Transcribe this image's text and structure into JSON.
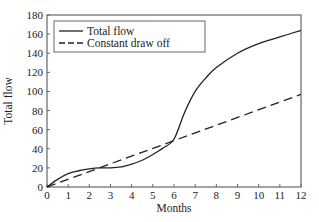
{
  "chart_data": {
    "type": "line",
    "title": "",
    "xlabel": "Months",
    "ylabel": "Total flow",
    "xlim": [
      0,
      12
    ],
    "ylim": [
      0,
      180
    ],
    "xticks": [
      0,
      1,
      2,
      3,
      4,
      5,
      6,
      7,
      8,
      9,
      10,
      11,
      12
    ],
    "yticks": [
      0,
      20,
      40,
      60,
      80,
      100,
      120,
      140,
      160,
      180
    ],
    "grid": false,
    "legend_position": "top-left",
    "series": [
      {
        "name": "Total flow",
        "style": "solid",
        "color": "#222222",
        "x": [
          0,
          0.5,
          1,
          1.5,
          2,
          2.5,
          3,
          3.5,
          4,
          4.5,
          5,
          5.5,
          6,
          6.5,
          7,
          7.5,
          8,
          9,
          10,
          11,
          12
        ],
        "y": [
          0,
          8,
          14,
          17,
          19,
          20,
          20,
          21,
          24,
          28,
          34,
          41,
          50,
          78,
          100,
          114,
          125,
          140,
          150,
          157,
          164
        ]
      },
      {
        "name": "Constant draw off",
        "style": "dashed",
        "color": "#222222",
        "x": [
          0,
          12
        ],
        "y": [
          0,
          97
        ]
      }
    ]
  }
}
